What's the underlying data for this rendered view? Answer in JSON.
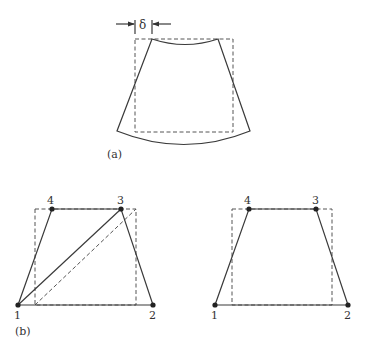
{
  "figure": {
    "panel_a": {
      "label": "(a)",
      "dimension_symbol": "δ",
      "description": "Rectangle (dashed) deformed into curved trapezoid (solid) — bending deformation"
    },
    "panel_b": {
      "label": "(b)",
      "left_element": {
        "nodes": [
          "1",
          "2",
          "3",
          "4"
        ],
        "description": "Quadrilateral split into two triangles via diagonal 1-3, with dashed original rectangle"
      },
      "right_element": {
        "nodes": [
          "1",
          "2",
          "3",
          "4"
        ],
        "description": "Quadrilateral element (trapezoid) with dashed original rectangle"
      }
    }
  }
}
